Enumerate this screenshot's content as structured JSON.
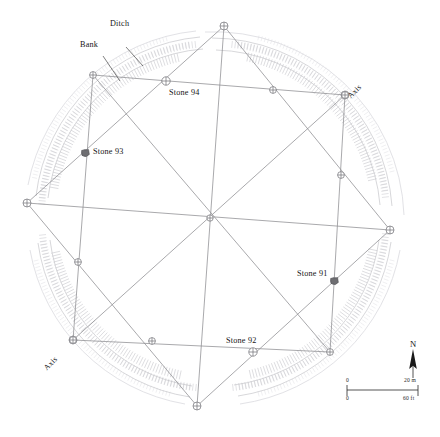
{
  "figure": {
    "type": "archaeological-site-plan"
  },
  "annotations": {
    "ditch": "Ditch",
    "bank": "Bank",
    "axis_ne": "Axis",
    "axis_sw": "Axis"
  },
  "stones": [
    {
      "id": "stone-94",
      "label": "Stone 94",
      "marker": "circle-cross",
      "x": 166,
      "y": 81
    },
    {
      "id": "stone-93",
      "label": "Stone 93",
      "marker": "filled-stone",
      "x": 85,
      "y": 153
    },
    {
      "id": "stone-92",
      "label": "Stone 92",
      "marker": "circle-cross",
      "x": 253,
      "y": 352
    },
    {
      "id": "stone-91",
      "label": "Stone 91",
      "marker": "filled-stone",
      "x": 334,
      "y": 281
    }
  ],
  "north_arrow": {
    "label": "N",
    "icon": "north-arrow-icon",
    "bearing_deg": 0
  },
  "scale_bar": {
    "metric": {
      "min": "0",
      "max": "20 m"
    },
    "imperial": {
      "min": "0",
      "max": "60 ft"
    }
  },
  "colors": {
    "line": "#8c8c90",
    "hachure": "#b9b9bd",
    "hachure_light": "#d8d8dc",
    "stone_fill": "#6e6e72",
    "text": "#161616",
    "background": "#ffffff"
  },
  "chart_data": {
    "type": "scatter",
    "title": "",
    "xlabel": "",
    "ylabel": "",
    "grid": false,
    "legend": "none",
    "survey_stations_outer_square": [
      {
        "x": 224,
        "y": 26
      },
      {
        "x": 345,
        "y": 95
      },
      {
        "x": 390,
        "y": 230
      },
      {
        "x": 197,
        "y": 406
      },
      {
        "x": 73,
        "y": 340
      },
      {
        "x": 27,
        "y": 203
      }
    ],
    "square_a": [
      {
        "x": 224,
        "y": 26
      },
      {
        "x": 390,
        "y": 230
      },
      {
        "x": 197,
        "y": 406
      },
      {
        "x": 27,
        "y": 203
      }
    ],
    "square_b": [
      {
        "x": 93,
        "y": 75
      },
      {
        "x": 345,
        "y": 95
      },
      {
        "x": 330,
        "y": 352
      },
      {
        "x": 73,
        "y": 340
      }
    ],
    "center_station": {
      "x": 210,
      "y": 218
    },
    "edge_stations": [
      {
        "x": 93,
        "y": 75
      },
      {
        "x": 166,
        "y": 81
      },
      {
        "x": 273,
        "y": 90
      },
      {
        "x": 345,
        "y": 95
      },
      {
        "x": 341,
        "y": 175
      },
      {
        "x": 334,
        "y": 281
      },
      {
        "x": 330,
        "y": 352
      },
      {
        "x": 253,
        "y": 352
      },
      {
        "x": 152,
        "y": 341
      },
      {
        "x": 73,
        "y": 340
      },
      {
        "x": 78,
        "y": 262
      },
      {
        "x": 85,
        "y": 153
      }
    ]
  }
}
